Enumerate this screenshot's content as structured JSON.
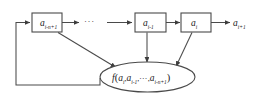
{
  "diagram": {
    "type": "block-diagram",
    "background_color": "#ffffff",
    "line_color": "#4a4a4a",
    "text_color": "#222222",
    "nodes": [
      {
        "id": "box-a-i-n-plus-1",
        "shape": "rectangle",
        "base": "a",
        "subscript": "i-n+1"
      },
      {
        "id": "box-a-i-minus-1",
        "shape": "rectangle",
        "base": "a",
        "subscript": "i-1"
      },
      {
        "id": "box-a-i",
        "shape": "rectangle",
        "base": "a",
        "subscript": "i"
      },
      {
        "id": "output-a-i-plus-1",
        "shape": "text",
        "base": "a",
        "subscript": "i+1"
      },
      {
        "id": "function-ellipse",
        "shape": "ellipse",
        "function_name": "f",
        "open_paren": "(",
        "close_paren": ")",
        "arguments": [
          {
            "base": "a",
            "subscript": "i"
          },
          {
            "base": "a",
            "subscript": "i-1"
          },
          {
            "base": "a",
            "subscript": "i-n+1"
          }
        ],
        "argument_separator": ",",
        "ellipsis": "···"
      }
    ],
    "ellipsis_between_boxes": "···",
    "edges": [
      {
        "id": "edge-box1-to-dots",
        "from": "box-a-i-n-plus-1",
        "to": "ellipsis",
        "arrow": true
      },
      {
        "id": "edge-dots-to-box2",
        "from": "ellipsis",
        "to": "box-a-i-minus-1",
        "arrow": true
      },
      {
        "id": "edge-box2-to-box3",
        "from": "box-a-i-minus-1",
        "to": "box-a-i",
        "arrow": true
      },
      {
        "id": "edge-box3-to-output",
        "from": "box-a-i",
        "to": "output-a-i-plus-1",
        "arrow": true
      },
      {
        "id": "edge-box1-to-function",
        "from": "box-a-i-n-plus-1",
        "to": "function-ellipse",
        "arrow": true
      },
      {
        "id": "edge-box2-to-function",
        "from": "box-a-i-minus-1",
        "to": "function-ellipse",
        "arrow": true
      },
      {
        "id": "edge-box3-to-function",
        "from": "box-a-i",
        "to": "function-ellipse",
        "arrow": true
      },
      {
        "id": "edge-feedback",
        "from": "function-ellipse",
        "to": "box-a-i-n-plus-1",
        "arrow": true
      }
    ]
  }
}
